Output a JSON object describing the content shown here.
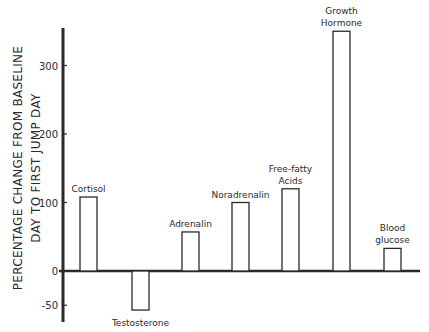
{
  "chart_data": {
    "type": "bar",
    "title": "",
    "xlabel": "",
    "ylabel": [
      "PERCENTAGE CHANGE FROM BASELINE",
      "DAY TO FIRST JUMP DAY"
    ],
    "ylim": [
      -60,
      360
    ],
    "yticks": [
      300,
      200,
      100,
      0,
      -50
    ],
    "ytick_labels": [
      "300",
      "200",
      "100",
      "0",
      "-50"
    ],
    "grid": false,
    "categories": [
      "Cortisol",
      "Testosterone",
      "Adrenalin",
      "Noradrenalin",
      "Free-fatty Acids",
      "Growth Hormone",
      "Blood glucose"
    ],
    "label_lines": [
      [
        "Cortisol"
      ],
      [
        "Testosterone"
      ],
      [
        "Adrenalin"
      ],
      [
        "Noradrenalin"
      ],
      [
        "Free-fatty",
        "Acids"
      ],
      [
        "Growth",
        "Hormone"
      ],
      [
        "Blood",
        "glucose"
      ]
    ],
    "values": [
      108,
      -57,
      57,
      100,
      120,
      350,
      33
    ],
    "colors": {
      "bar_fill": "#ffffff",
      "bar_stroke": "#2a2a2a",
      "axis": "#2a2a2a"
    }
  }
}
